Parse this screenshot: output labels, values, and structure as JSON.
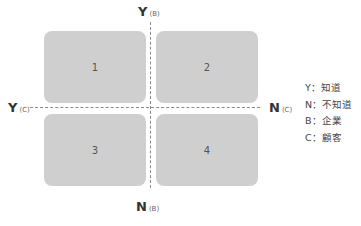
{
  "diagram": {
    "type": "2x2 matrix",
    "axes": {
      "top": {
        "letter": "Y",
        "sub": "(B)"
      },
      "bottom": {
        "letter": "N",
        "sub": "(B)"
      },
      "left": {
        "letter": "Y",
        "sub": "(C)"
      },
      "right": {
        "letter": "N",
        "sub": "(C)"
      }
    },
    "quadrants": [
      {
        "label": "1"
      },
      {
        "label": "2"
      },
      {
        "label": "3"
      },
      {
        "label": "4"
      }
    ],
    "legend": [
      {
        "text": "Y：知道"
      },
      {
        "text": "N：不知道"
      },
      {
        "text": "B：企業"
      },
      {
        "text": "C：顧客"
      }
    ],
    "colors": {
      "box_fill": "#cfcfcf",
      "dash_line": "#8a8a8a",
      "text": "#333333"
    }
  }
}
